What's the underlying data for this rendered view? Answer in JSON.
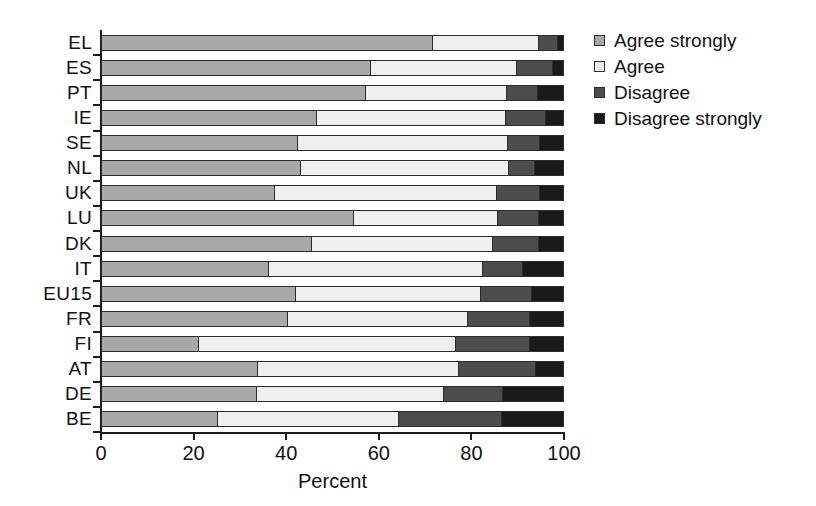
{
  "chart_data": {
    "type": "bar",
    "orientation": "horizontal",
    "stacked": true,
    "title": "",
    "xlabel": "Percent",
    "ylabel": "",
    "xlim": [
      0,
      100
    ],
    "xticks": [
      0,
      20,
      40,
      60,
      80,
      100
    ],
    "grid": false,
    "legend_position": "right",
    "categories": [
      "EL",
      "ES",
      "PT",
      "IE",
      "SE",
      "NL",
      "UK",
      "LU",
      "DK",
      "IT",
      "EU15",
      "FR",
      "FI",
      "AT",
      "DE",
      "BE"
    ],
    "series": [
      {
        "name": "Agree strongly",
        "color": "#a8a8a8",
        "values": [
          71.7,
          58.3,
          57.2,
          46.7,
          42.5,
          43.2,
          37.6,
          54.6,
          45.6,
          36.3,
          42.1,
          40.4,
          21.2,
          33.9,
          33.7,
          25.3
        ]
      },
      {
        "name": "Agree",
        "color": "#efefef",
        "values": [
          22.9,
          31.5,
          30.5,
          40.8,
          45.4,
          44.9,
          47.9,
          31.2,
          39.1,
          46.2,
          40.0,
          38.9,
          55.5,
          43.4,
          40.4,
          39.1
        ]
      },
      {
        "name": "Disagree",
        "color": "#4d4d4d",
        "values": [
          4.1,
          7.8,
          6.7,
          8.6,
          7.0,
          5.6,
          9.3,
          8.7,
          9.9,
          8.6,
          11.0,
          13.4,
          16.0,
          16.7,
          12.7,
          22.2
        ]
      },
      {
        "name": "Disagree strongly",
        "color": "#1a1a1a",
        "values": [
          1.3,
          2.4,
          5.6,
          3.9,
          5.1,
          6.3,
          5.2,
          5.5,
          5.4,
          8.9,
          6.9,
          7.3,
          7.3,
          6.0,
          13.2,
          13.4
        ]
      }
    ],
    "legend": [
      "Agree strongly",
      "Agree",
      "Disagree",
      "Disagree strongly"
    ]
  }
}
